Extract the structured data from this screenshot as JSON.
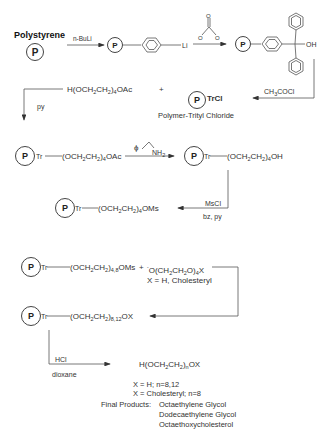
{
  "step1": {
    "start_label": "Polystyrene",
    "polymer_symbol": "P",
    "reagent_1": "n-BuLi",
    "lithiated_suffix": "Li",
    "reagent_2_structure": "carbonate (O=C(O-)O-)",
    "reagent_2_atoms": [
      "O",
      "O",
      "O"
    ],
    "product_oh": "OH"
  },
  "step2": {
    "reagent": "CH3COCl",
    "product_label": "TrCl",
    "product_name": "Polymer-Trityl Chloride"
  },
  "step3": {
    "reactant": "H(OCH2CH2)4OAc",
    "plus": "+",
    "conditions": "py",
    "product": "Tr—(OCH2CH2)4OAc"
  },
  "step4": {
    "reagent": "ϕ–CH2–NH2",
    "reagent_symbol": "ϕ",
    "reagent_group": "NH2",
    "product": "Tr—(OCH2CH2)4OH"
  },
  "step5": {
    "reagent": "MsCl",
    "conditions": "bz, py",
    "product": "Tr—(OCH2CH2)4OMs"
  },
  "step6": {
    "reactant": "Tr—(OCH2CH2)4,8OMs",
    "plus": "+",
    "nucleophile": "⁻O(CH2CH2O)4X",
    "x_definition": "X = H, Cholesteryl",
    "product": "Tr—(OCH2CH2)8,12OX"
  },
  "step7": {
    "reagent": "HCl",
    "conditions": "dioxane",
    "product": "H(OCH2CH2)nOX",
    "cases": [
      "X = H; n=8,12",
      "X = Cholesteryl; n=8"
    ],
    "final_products_label": "Final Products:",
    "final_products": [
      "Octaethylene Glycol",
      "Dodecaethylene Glycol",
      "Octaethoxycholesterol"
    ]
  }
}
